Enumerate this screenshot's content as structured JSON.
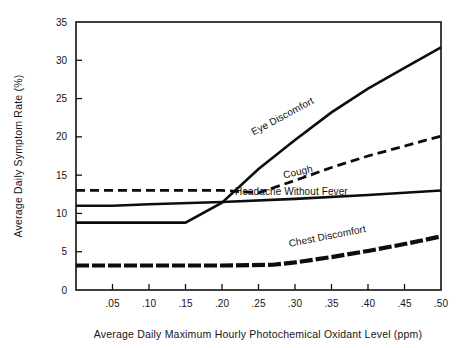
{
  "chart_data": {
    "type": "line",
    "title": "",
    "xlabel": "Average Daily Maximum Hourly Photochemical  Oxidant Level (ppm)",
    "ylabel": "Average Daily Symptom Rate (%)",
    "xlim": [
      0.0,
      0.5
    ],
    "ylim": [
      0,
      35
    ],
    "grid": false,
    "legend": "inline-labels",
    "xticks": [
      0.05,
      0.1,
      0.15,
      0.2,
      0.25,
      0.3,
      0.35,
      0.4,
      0.45,
      0.5
    ],
    "xticklabels": [
      ".05",
      ".10",
      ".15",
      ".20",
      ".25",
      ".30",
      ".35",
      ".40",
      ".45",
      ".50"
    ],
    "yticks": [
      0,
      5,
      10,
      15,
      20,
      25,
      30,
      35
    ],
    "yticklabels": [
      "0",
      "5",
      "10",
      "15",
      "20",
      "25",
      "30",
      "35"
    ],
    "series": [
      {
        "name": "Eye Discomfort",
        "label": "Eye Discomfort",
        "style": "solid",
        "x": [
          0.0,
          0.15,
          0.2,
          0.25,
          0.3,
          0.35,
          0.4,
          0.45,
          0.5
        ],
        "values": [
          8.8,
          8.8,
          11.4,
          15.8,
          19.6,
          23.2,
          26.3,
          29.0,
          31.7
        ]
      },
      {
        "name": "Cough",
        "label": "Cough",
        "style": "dashed",
        "x": [
          0.0,
          0.1,
          0.2,
          0.25,
          0.3,
          0.35,
          0.4,
          0.45,
          0.5
        ],
        "values": [
          13.0,
          13.0,
          13.0,
          12.7,
          14.3,
          16.0,
          17.5,
          18.8,
          20.1
        ]
      },
      {
        "name": "Headache Without Fever",
        "label": "Headache Without Fever",
        "style": "solid",
        "x": [
          0.0,
          0.05,
          0.1,
          0.2,
          0.3,
          0.4,
          0.5
        ],
        "values": [
          11.0,
          11.0,
          11.2,
          11.5,
          11.9,
          12.4,
          13.0
        ]
      },
      {
        "name": "Chest Discomfort",
        "label": "Chest Discomfort",
        "style": "dash-dot",
        "x": [
          0.0,
          0.1,
          0.2,
          0.27,
          0.3,
          0.35,
          0.4,
          0.45,
          0.5
        ],
        "values": [
          3.2,
          3.2,
          3.2,
          3.3,
          3.6,
          4.3,
          5.1,
          6.0,
          7.0
        ]
      }
    ],
    "annotations": [
      {
        "text": "Eye Discomfort",
        "x": 0.285,
        "y": 22.3,
        "rotate": -28
      },
      {
        "text": "Cough",
        "x": 0.305,
        "y": 15.0,
        "rotate": -13
      },
      {
        "text": "Headache Without Fever",
        "x": 0.295,
        "y": 12.4,
        "rotate": 0
      },
      {
        "text": "Chest Discomfort",
        "x": 0.345,
        "y": 6.6,
        "rotate": -11
      }
    ],
    "colors": {
      "line": "#0d0d0d",
      "axis": "#111111",
      "text": "#151515",
      "background": "#ffffff"
    }
  }
}
